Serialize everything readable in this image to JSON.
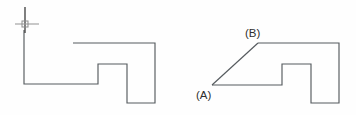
{
  "figure": {
    "background_color": "#fefefe",
    "line_color": "#555a5e",
    "label_color": "#2e2e2e",
    "cursor_color": "#3b3b3b",
    "width": 356,
    "height": 115
  },
  "labels": {
    "point_a": "(A)",
    "point_b": "(B)"
  },
  "shapes": {
    "left": {
      "name": "original-stepped-profile",
      "points": "24,30 24,84 98,84 98,64 127,64 127,103 155,103 155,43 73,43"
    },
    "right": {
      "name": "chamfered-stepped-profile",
      "points": "212,85 282,85 282,64 311,64 311,103 339,103 339,43 258,43"
    },
    "chamfer_edge": {
      "name": "chamfer-diagonal",
      "x1": 212,
      "y1": 85,
      "x2": 258,
      "y2": 43
    }
  },
  "cursor": {
    "name": "crosshair-cursor",
    "vertical": {
      "x": 25,
      "y1": 7,
      "y2": 33
    },
    "horizontal": {
      "y": 24,
      "x1": 15,
      "x2": 39
    },
    "pick_box": {
      "x": 22,
      "y": 21,
      "size": 6
    }
  },
  "label_positions": {
    "point_a": {
      "x": 196,
      "y": 99
    },
    "point_b": {
      "x": 245,
      "y": 37
    }
  }
}
